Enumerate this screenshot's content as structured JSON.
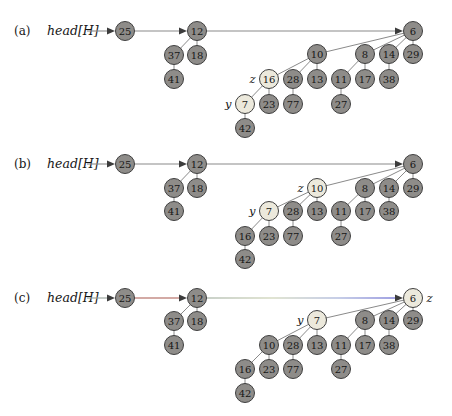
{
  "style": {
    "node_radius": 9.5,
    "node_fill": "#8e8c89",
    "node_fill_highlight": "#ece9dc",
    "node_stroke": "#3f3f3f",
    "edge_color": "#8a8a8a",
    "arrowhead_color": "#3c3c3c",
    "background": "#ffffff"
  },
  "panels": [
    {
      "id": "a",
      "label": "(a)",
      "pointer_text": "head[H]",
      "label_x": 14,
      "label_y": 31,
      "pointer_x": 47,
      "pointer_y": 31,
      "arrows": [
        {
          "from_x": 87,
          "tip_x": 115,
          "y": 31
        },
        {
          "from_x": 135,
          "tip_x": 187,
          "y": 31
        },
        {
          "from_x": 207,
          "tip_x": 403,
          "y": 31
        }
      ],
      "nodes": [
        {
          "v": "25",
          "x": 125,
          "y": 31
        },
        {
          "v": "12",
          "x": 197,
          "y": 31
        },
        {
          "v": "6",
          "x": 413,
          "y": 31
        },
        {
          "v": "37",
          "x": 174,
          "y": 55
        },
        {
          "v": "18",
          "x": 197,
          "y": 55
        },
        {
          "v": "10",
          "x": 317,
          "y": 54
        },
        {
          "v": "8",
          "x": 365,
          "y": 54
        },
        {
          "v": "14",
          "x": 389,
          "y": 54
        },
        {
          "v": "29",
          "x": 413,
          "y": 54
        },
        {
          "v": "41",
          "x": 174,
          "y": 79
        },
        {
          "v": "16",
          "x": 269,
          "y": 79,
          "hl": true,
          "tag": "z",
          "tag_side": "left"
        },
        {
          "v": "28",
          "x": 293,
          "y": 79
        },
        {
          "v": "13",
          "x": 317,
          "y": 79
        },
        {
          "v": "11",
          "x": 341,
          "y": 79
        },
        {
          "v": "17",
          "x": 365,
          "y": 79
        },
        {
          "v": "38",
          "x": 389,
          "y": 79
        },
        {
          "v": "7",
          "x": 245,
          "y": 104,
          "hl": true,
          "tag": "y",
          "tag_side": "left"
        },
        {
          "v": "23",
          "x": 269,
          "y": 104
        },
        {
          "v": "77",
          "x": 293,
          "y": 104
        },
        {
          "v": "27",
          "x": 341,
          "y": 104
        },
        {
          "v": "42",
          "x": 245,
          "y": 128
        }
      ],
      "edges": [
        [
          "12",
          "37"
        ],
        [
          "12",
          "18"
        ],
        [
          "37",
          "41"
        ],
        [
          "6",
          "10"
        ],
        [
          "6",
          "8"
        ],
        [
          "6",
          "14"
        ],
        [
          "6",
          "29"
        ],
        [
          "10",
          "16"
        ],
        [
          "10",
          "28"
        ],
        [
          "10",
          "13"
        ],
        [
          "8",
          "11"
        ],
        [
          "8",
          "17"
        ],
        [
          "14",
          "38"
        ],
        [
          "16",
          "7"
        ],
        [
          "16",
          "23"
        ],
        [
          "28",
          "77"
        ],
        [
          "11",
          "27"
        ],
        [
          "7",
          "42"
        ]
      ]
    },
    {
      "id": "b",
      "label": "(b)",
      "pointer_text": "head[H]",
      "label_x": 14,
      "label_y": 164,
      "pointer_x": 47,
      "pointer_y": 164,
      "arrows": [
        {
          "from_x": 87,
          "tip_x": 115,
          "y": 164
        },
        {
          "from_x": 135,
          "tip_x": 187,
          "y": 164
        },
        {
          "from_x": 207,
          "tip_x": 403,
          "y": 164
        }
      ],
      "nodes": [
        {
          "v": "25",
          "x": 125,
          "y": 164
        },
        {
          "v": "12",
          "x": 197,
          "y": 164
        },
        {
          "v": "6",
          "x": 413,
          "y": 164
        },
        {
          "v": "37",
          "x": 174,
          "y": 188
        },
        {
          "v": "18",
          "x": 197,
          "y": 188
        },
        {
          "v": "10",
          "x": 317,
          "y": 188,
          "hl": true,
          "tag": "z",
          "tag_side": "left"
        },
        {
          "v": "8",
          "x": 365,
          "y": 188
        },
        {
          "v": "14",
          "x": 389,
          "y": 188
        },
        {
          "v": "29",
          "x": 413,
          "y": 188
        },
        {
          "v": "41",
          "x": 174,
          "y": 211
        },
        {
          "v": "7",
          "x": 269,
          "y": 211,
          "hl": true,
          "tag": "y",
          "tag_side": "left"
        },
        {
          "v": "28",
          "x": 293,
          "y": 211
        },
        {
          "v": "13",
          "x": 317,
          "y": 211
        },
        {
          "v": "11",
          "x": 341,
          "y": 211
        },
        {
          "v": "17",
          "x": 365,
          "y": 211
        },
        {
          "v": "38",
          "x": 389,
          "y": 211
        },
        {
          "v": "16",
          "x": 245,
          "y": 236
        },
        {
          "v": "23",
          "x": 269,
          "y": 236
        },
        {
          "v": "77",
          "x": 293,
          "y": 236
        },
        {
          "v": "27",
          "x": 341,
          "y": 236
        },
        {
          "v": "42",
          "x": 245,
          "y": 259
        }
      ],
      "edges": [
        [
          "12",
          "37"
        ],
        [
          "12",
          "18"
        ],
        [
          "37",
          "41"
        ],
        [
          "6",
          "10"
        ],
        [
          "6",
          "8"
        ],
        [
          "6",
          "14"
        ],
        [
          "6",
          "29"
        ],
        [
          "10",
          "7"
        ],
        [
          "10",
          "28"
        ],
        [
          "10",
          "13"
        ],
        [
          "8",
          "11"
        ],
        [
          "8",
          "17"
        ],
        [
          "14",
          "38"
        ],
        [
          "7",
          "16"
        ],
        [
          "7",
          "23"
        ],
        [
          "28",
          "77"
        ],
        [
          "11",
          "27"
        ],
        [
          "16",
          "42"
        ]
      ]
    },
    {
      "id": "c",
      "label": "(c)",
      "pointer_text": "head[H]",
      "label_x": 14,
      "label_y": 298,
      "pointer_x": 47,
      "pointer_y": 298,
      "arrows": [
        {
          "from_x": 87,
          "tip_x": 115,
          "y": 298,
          "color": "#97a39c"
        },
        {
          "from_x": 135,
          "tip_x": 187,
          "y": 298,
          "color": "#a8564c"
        },
        {
          "from_x": 207,
          "tip_x": 403,
          "y": 298,
          "gradient": [
            "#95a494",
            "#c2c9a5",
            "#8f9ed0",
            "#3939c4"
          ]
        }
      ],
      "nodes": [
        {
          "v": "25",
          "x": 125,
          "y": 298
        },
        {
          "v": "12",
          "x": 197,
          "y": 298
        },
        {
          "v": "6",
          "x": 413,
          "y": 298,
          "hl": true,
          "tag": "z",
          "tag_side": "right"
        },
        {
          "v": "37",
          "x": 174,
          "y": 321
        },
        {
          "v": "18",
          "x": 197,
          "y": 321
        },
        {
          "v": "7",
          "x": 317,
          "y": 320,
          "hl": true,
          "tag": "y",
          "tag_side": "left"
        },
        {
          "v": "8",
          "x": 365,
          "y": 320
        },
        {
          "v": "14",
          "x": 389,
          "y": 320
        },
        {
          "v": "29",
          "x": 413,
          "y": 320
        },
        {
          "v": "41",
          "x": 174,
          "y": 345
        },
        {
          "v": "10",
          "x": 269,
          "y": 345
        },
        {
          "v": "28",
          "x": 293,
          "y": 345
        },
        {
          "v": "13",
          "x": 317,
          "y": 345
        },
        {
          "v": "11",
          "x": 341,
          "y": 345
        },
        {
          "v": "17",
          "x": 365,
          "y": 345
        },
        {
          "v": "38",
          "x": 389,
          "y": 345
        },
        {
          "v": "16",
          "x": 245,
          "y": 369
        },
        {
          "v": "23",
          "x": 269,
          "y": 369
        },
        {
          "v": "77",
          "x": 293,
          "y": 369
        },
        {
          "v": "27",
          "x": 341,
          "y": 369
        },
        {
          "v": "42",
          "x": 245,
          "y": 393
        }
      ],
      "edges": [
        [
          "12",
          "37"
        ],
        [
          "12",
          "18"
        ],
        [
          "37",
          "41"
        ],
        [
          "6",
          "7"
        ],
        [
          "6",
          "8"
        ],
        [
          "6",
          "14"
        ],
        [
          "6",
          "29"
        ],
        [
          "7",
          "10"
        ],
        [
          "7",
          "28"
        ],
        [
          "7",
          "13"
        ],
        [
          "8",
          "11"
        ],
        [
          "8",
          "17"
        ],
        [
          "14",
          "38"
        ],
        [
          "10",
          "16"
        ],
        [
          "10",
          "23"
        ],
        [
          "28",
          "77"
        ],
        [
          "11",
          "27"
        ],
        [
          "16",
          "42"
        ]
      ]
    }
  ]
}
